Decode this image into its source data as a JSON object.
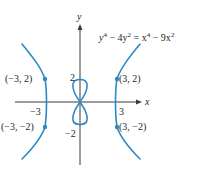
{
  "figure": {
    "equation": {
      "lhs": "y",
      "lhs_exp": "4",
      "mid1": " − 4y",
      "mid1_exp": "2",
      "eq": " = x",
      "rhs_exp": "4",
      "mid2": " − 9x",
      "mid2_exp": "2"
    },
    "axes": {
      "x_label": "x",
      "y_label": "y",
      "tick_labels": {
        "x_pos": "3",
        "x_neg": "−3",
        "y_pos": "2",
        "y_neg": "−2"
      }
    },
    "points": [
      {
        "label": "(−3, 2)",
        "x": -3,
        "y": 2
      },
      {
        "label": "(3, 2)",
        "x": 3,
        "y": 2
      },
      {
        "label": "(−3, −2)",
        "x": -3,
        "y": -2
      },
      {
        "label": "(3, −2)",
        "x": 3,
        "y": -2
      }
    ],
    "colors": {
      "curve": "#2b8ac6",
      "point": "#2b8ac6",
      "axis": "#3a3a3a",
      "text": "#231f20"
    }
  }
}
